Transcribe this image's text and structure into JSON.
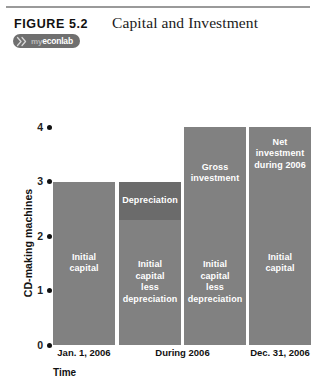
{
  "figure": {
    "number_label": "FIGURE  5.2",
    "title": "Capital and Investment",
    "badge": {
      "mark_name": "myeconlab-x-mark",
      "prefix": "my",
      "name": "econlab"
    }
  },
  "chart_data": {
    "type": "bar",
    "title": "Capital and Investment",
    "xlabel": "Time",
    "ylabel": "CD-making machines",
    "ylim": [
      0,
      4
    ],
    "yticks": [
      0,
      1,
      2,
      3,
      4
    ],
    "ytick_labels": [
      "0",
      "1",
      "2",
      "3",
      "4"
    ],
    "grid": false,
    "legend": "none",
    "categories": [
      "Jan. 1, 2006",
      "During 2006",
      "Dec. 31, 2006"
    ],
    "bars": [
      {
        "name": "jan-1-2006",
        "category": "Jan. 1, 2006",
        "total": 3,
        "segments": [
          {
            "name": "initial-capital",
            "label": "Initial\ncapital",
            "value": 3,
            "from": 0,
            "to": 3,
            "shade": "main",
            "label_pos": "center"
          }
        ]
      },
      {
        "name": "during-2006-depreciation",
        "category": "During 2006",
        "total": 3,
        "segments": [
          {
            "name": "depreciation",
            "label": "Depreciation",
            "value": 0.7,
            "from": 2.3,
            "to": 3,
            "shade": "dark",
            "label_pos": "center"
          },
          {
            "name": "initial-capital-less-depreciation",
            "label": "Initial\ncapital\nless\ndepreciation",
            "value": 2.3,
            "from": 0,
            "to": 2.3,
            "shade": "main",
            "label_pos": "center"
          }
        ]
      },
      {
        "name": "during-2006-gross-investment",
        "category": "During 2006",
        "total": 4,
        "segments": [
          {
            "name": "gross-investment",
            "label": "Gross\ninvestment",
            "value": 1.7,
            "from": 2.3,
            "to": 4,
            "shade": "main",
            "label_pos": "center"
          },
          {
            "name": "initial-capital-less-depreciation",
            "label": "Initial\ncapital\nless\ndepreciation",
            "value": 2.3,
            "from": 0,
            "to": 2.3,
            "shade": "main",
            "label_pos": "center"
          }
        ]
      },
      {
        "name": "dec-31-2006",
        "category": "Dec. 31, 2006",
        "total": 4,
        "segments": [
          {
            "name": "net-investment-during-2006",
            "label": "Net\ninvestment\nduring 2006",
            "value": 1,
            "from": 3,
            "to": 4,
            "shade": "main",
            "label_pos": "center"
          },
          {
            "name": "initial-capital",
            "label": "Initial\ncapital",
            "value": 3,
            "from": 0,
            "to": 3,
            "shade": "main",
            "label_pos": "center"
          }
        ]
      }
    ],
    "xtick_labels": [
      "Jan. 1, 2006",
      "During 2006",
      "Dec. 31, 2006"
    ],
    "colors": {
      "bar_main": "#818181",
      "bar_dark": "#6b6b6b",
      "label_text": "#ffffff",
      "axis_text": "#111111",
      "rule": "#9a9a9a",
      "badge_bg": "#6f6f6f"
    }
  }
}
